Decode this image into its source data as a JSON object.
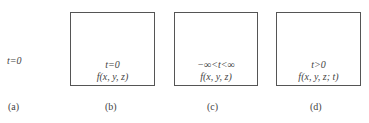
{
  "panels": [
    {
      "label": "(a)",
      "lines": [
        "t=0"
      ]
    },
    {
      "label": "(b)",
      "lines": [
        "t=0",
        "f(x, y, z)"
      ]
    },
    {
      "label": "(c)",
      "lines": [
        "−∞<t<∞",
        "f(x, y, z)"
      ]
    },
    {
      "label": "(d)",
      "lines": [
        "t>0",
        "f(x, y, z; t)"
      ]
    }
  ]
}
